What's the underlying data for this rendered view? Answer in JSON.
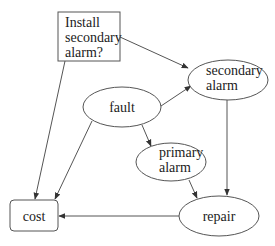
{
  "diagram": {
    "type": "influence-diagram",
    "nodes": {
      "install": {
        "kind": "decision",
        "lines": [
          "Install",
          "secondary",
          "alarm?"
        ]
      },
      "secondary_alarm": {
        "kind": "chance",
        "lines": [
          "secondary",
          "alarm"
        ]
      },
      "fault": {
        "kind": "chance",
        "lines": [
          "fault"
        ]
      },
      "primary_alarm": {
        "kind": "chance",
        "lines": [
          "primary",
          "alarm"
        ]
      },
      "cost": {
        "kind": "value",
        "lines": [
          "cost"
        ]
      },
      "repair": {
        "kind": "chance",
        "lines": [
          "repair"
        ]
      }
    },
    "edges": [
      {
        "from": "install",
        "to": "secondary_alarm"
      },
      {
        "from": "install",
        "to": "cost"
      },
      {
        "from": "fault",
        "to": "secondary_alarm"
      },
      {
        "from": "fault",
        "to": "primary_alarm"
      },
      {
        "from": "fault",
        "to": "cost"
      },
      {
        "from": "primary_alarm",
        "to": "repair"
      },
      {
        "from": "secondary_alarm",
        "to": "repair"
      },
      {
        "from": "repair",
        "to": "cost"
      }
    ],
    "colors": {
      "stroke": "#555555",
      "text": "#222222",
      "background": "#ffffff"
    }
  }
}
